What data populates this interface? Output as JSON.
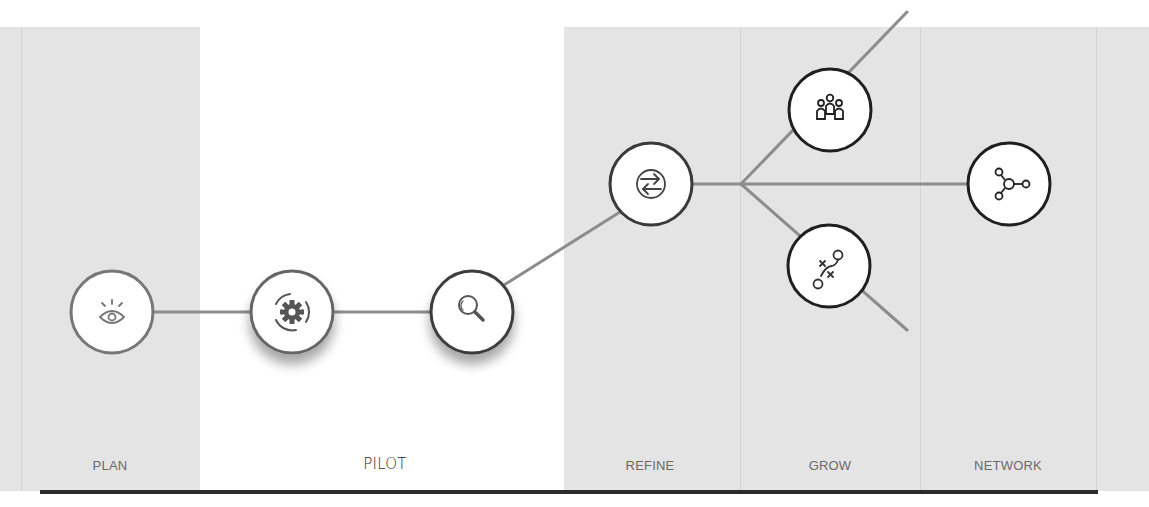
{
  "diagram": {
    "title": "",
    "stages": [
      {
        "id": "plan",
        "label": "PLAN"
      },
      {
        "id": "pilot",
        "label": "PILOT"
      },
      {
        "id": "refine",
        "label": "REFINE"
      },
      {
        "id": "grow",
        "label": "GROW"
      },
      {
        "id": "network",
        "label": "NETWORK"
      }
    ],
    "nodes": [
      {
        "id": "vision",
        "stage": "plan",
        "icon": "eye-icon"
      },
      {
        "id": "setup",
        "stage": "pilot",
        "icon": "gear-rotate-icon"
      },
      {
        "id": "review",
        "stage": "pilot",
        "icon": "magnifier-icon"
      },
      {
        "id": "iterate",
        "stage": "refine",
        "icon": "exchange-arrows-icon"
      },
      {
        "id": "community",
        "stage": "grow",
        "icon": "people-group-icon"
      },
      {
        "id": "strategy",
        "stage": "grow",
        "icon": "playbook-strategy-icon"
      },
      {
        "id": "connect",
        "stage": "network",
        "icon": "network-nodes-icon"
      }
    ],
    "edges": [
      [
        "vision",
        "setup"
      ],
      [
        "setup",
        "review"
      ],
      [
        "review",
        "iterate"
      ],
      [
        "iterate",
        "branch"
      ],
      [
        "branch",
        "community"
      ],
      [
        "branch",
        "strategy"
      ],
      [
        "branch",
        "connect"
      ]
    ],
    "colors": {
      "band": "#e4e4e4",
      "line": "#8c8c8c",
      "node_outline_light": "#6e6e6e",
      "node_outline_dark": "#1f1f1f",
      "baseline": "#2b2b2b"
    }
  }
}
